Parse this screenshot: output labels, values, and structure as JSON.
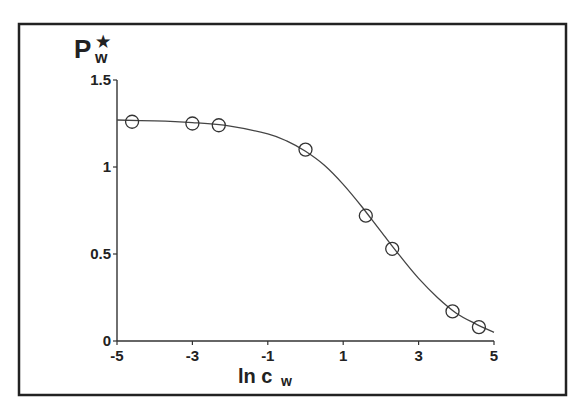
{
  "chart_data": {
    "type": "scatter",
    "title": "",
    "xlabel": "ln c_w",
    "ylabel": "P_w*",
    "xlabel_parts": {
      "main": "ln c",
      "sub": "w"
    },
    "ylabel_parts": {
      "main": "P",
      "sub": "w",
      "sup": "★"
    },
    "xlim": [
      -5,
      5
    ],
    "ylim": [
      0,
      1.5
    ],
    "xticks": [
      -5,
      -3,
      -1,
      1,
      3,
      5
    ],
    "xtick_labels": [
      "-5",
      "-3",
      "-1",
      "1",
      "3",
      "5"
    ],
    "yticks": [
      0,
      0.5,
      1,
      1.5
    ],
    "ytick_labels": [
      "0",
      "0.5",
      "1",
      "1.5"
    ],
    "grid": false,
    "legend": null,
    "series": [
      {
        "name": "measured",
        "style": "open-circle-markers",
        "x": [
          -4.6,
          -3.0,
          -2.3,
          0.0,
          1.6,
          2.3,
          3.9,
          4.6
        ],
        "y": [
          1.26,
          1.25,
          1.24,
          1.1,
          0.72,
          0.53,
          0.17,
          0.08
        ]
      },
      {
        "name": "fitted curve",
        "style": "solid-line",
        "x": [
          -5.0,
          -4.0,
          -3.0,
          -2.0,
          -1.0,
          -0.5,
          0.0,
          0.5,
          1.0,
          1.5,
          2.0,
          2.5,
          3.0,
          3.5,
          4.0,
          4.5,
          5.0
        ],
        "y": [
          1.27,
          1.265,
          1.255,
          1.235,
          1.19,
          1.15,
          1.09,
          1.01,
          0.9,
          0.77,
          0.63,
          0.49,
          0.36,
          0.25,
          0.16,
          0.1,
          0.05
        ]
      }
    ]
  }
}
